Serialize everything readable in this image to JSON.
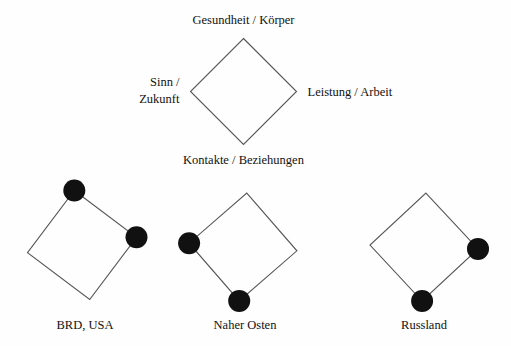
{
  "figure": {
    "background_color": "#fefefe",
    "line_color": "#555555",
    "dot_color": "#111111",
    "text_color": "#111111"
  },
  "legend_diamond": {
    "name": "value-quadrant-legend",
    "center": {
      "x": 243.5,
      "y": 91.5
    },
    "radius": 53,
    "axes": {
      "top": "Gesundheit / Körper",
      "right": "Leistung / Arbeit",
      "bottom": "Kontakte / Beziehungen",
      "left_line1": "Sinn /",
      "left_line2": "Zukunft"
    }
  },
  "groups": [
    {
      "id": "brd-usa",
      "label": "BRD, USA",
      "center": {
        "x": 82,
        "y": 245
      },
      "radius": 55,
      "label_x": 85,
      "label_y": 329,
      "rotation": -8,
      "filled_vertices": [
        "top",
        "right"
      ],
      "dot_radius": 11
    },
    {
      "id": "naher-osten",
      "label": "Naher Osten",
      "center": {
        "x": 243,
        "y": 247
      },
      "radius": 54,
      "label_x": 245,
      "label_y": 329,
      "rotation": 4,
      "filled_vertices": [
        "left",
        "bottom"
      ],
      "dot_radius": 11
    },
    {
      "id": "russland",
      "label": "Russland",
      "center": {
        "x": 424,
        "y": 247
      },
      "radius": 54,
      "label_x": 424,
      "label_y": 329,
      "rotation": 2,
      "filled_vertices": [
        "right",
        "bottom"
      ],
      "dot_radius": 11
    }
  ]
}
